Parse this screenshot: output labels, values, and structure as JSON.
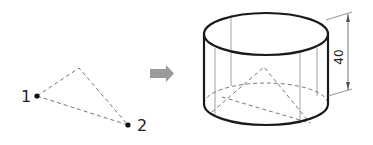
{
  "diagram": {
    "points": [
      {
        "label": "1",
        "x": 37,
        "y": 96
      },
      {
        "label": "2",
        "x": 128,
        "y": 125
      }
    ],
    "apex": {
      "x": 79,
      "y": 68
    },
    "arrow_color": "#9a9a9a",
    "cylinder": {
      "cx": 266,
      "top_cy": 34,
      "bottom_cy": 104,
      "rx": 62,
      "ry": 21,
      "stroke": "#1a1a1a"
    },
    "dimension": {
      "value": "40",
      "color": "#555555"
    }
  }
}
